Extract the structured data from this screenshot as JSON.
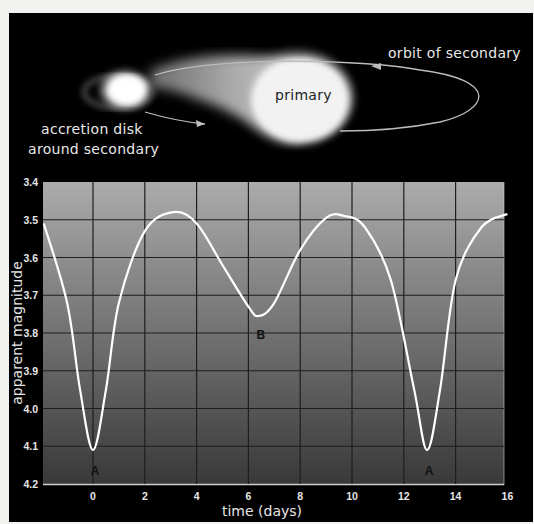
{
  "illustration": {
    "labels": {
      "orbit": "orbit of secondary",
      "primary": "primary",
      "disk_line1": "accretion disk",
      "disk_line2": "around secondary"
    }
  },
  "chart_data": {
    "type": "line",
    "title": "",
    "xlabel": "time (days)",
    "ylabel": "apparent magnitude",
    "xlim": [
      -1.9,
      16
    ],
    "ylim": [
      3.4,
      4.2
    ],
    "y_inverted": true,
    "grid": true,
    "x_ticks": [
      "0",
      "2",
      "4",
      "6",
      "8",
      "10",
      "12",
      "14",
      "16"
    ],
    "y_ticks": [
      "3.4",
      "3.5",
      "3.6",
      "3.7",
      "3.8",
      "3.9",
      "4.0",
      "4.1",
      "4.2"
    ],
    "series": [
      {
        "name": "light curve",
        "color": "#ffffff",
        "x": [
          -1.9,
          -1,
          -0.5,
          0,
          0.5,
          1,
          2,
          3.1,
          4,
          5,
          6,
          6.4,
          7,
          8,
          9,
          9.7,
          10.5,
          11.5,
          12.4,
          12.9,
          13.4,
          14,
          15,
          16
        ],
        "y": [
          3.51,
          3.72,
          3.95,
          4.11,
          3.95,
          3.72,
          3.53,
          3.48,
          3.51,
          3.62,
          3.73,
          3.755,
          3.72,
          3.58,
          3.495,
          3.49,
          3.52,
          3.66,
          3.95,
          4.11,
          3.95,
          3.66,
          3.52,
          3.485
        ]
      }
    ],
    "annotations": [
      {
        "text": "A",
        "x": 0,
        "y": 4.15
      },
      {
        "text": "B",
        "x": 6.4,
        "y": 3.79
      },
      {
        "text": "A",
        "x": 12.9,
        "y": 4.15
      }
    ],
    "colors": {
      "plot_top": "#ababab",
      "plot_bottom": "#393939",
      "grid": "#1e1e1e",
      "frame": "#000000"
    }
  }
}
